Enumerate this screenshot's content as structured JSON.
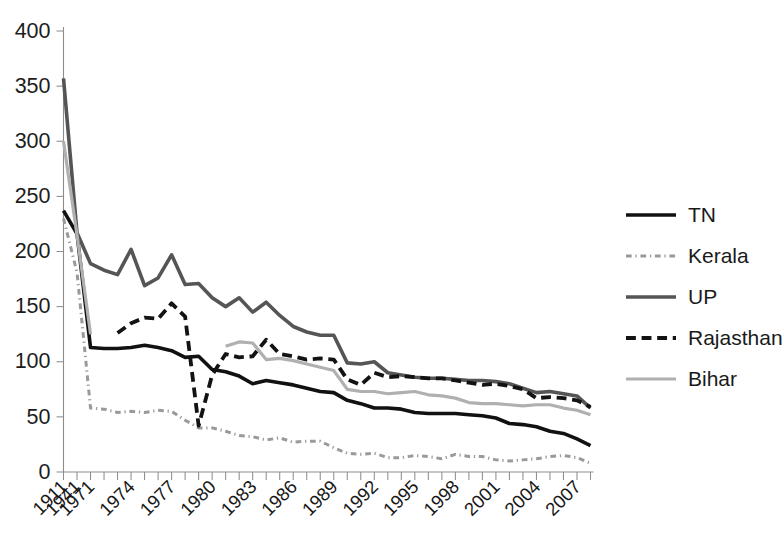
{
  "chart_data": {
    "type": "line",
    "title": "",
    "xlabel": "",
    "ylabel": "",
    "ylim": [
      0,
      400
    ],
    "ytick_values": [
      0,
      50,
      100,
      150,
      200,
      250,
      300,
      350,
      400
    ],
    "ytick_labels": [
      "0",
      "50",
      "100",
      "150",
      "200",
      "250",
      "300",
      "350",
      "400"
    ],
    "grid": false,
    "legend_position": "right",
    "x_axis_note": "Irregular axis: early census years 1911 and 1941, then annual ticks from 1971 to 2008",
    "x_slots": [
      "1911",
      "1941",
      "1971",
      "1972",
      "1973",
      "1974",
      "1975",
      "1976",
      "1977",
      "1978",
      "1979",
      "1980",
      "1981",
      "1982",
      "1983",
      "1984",
      "1985",
      "1986",
      "1987",
      "1988",
      "1989",
      "1990",
      "1991",
      "1992",
      "1993",
      "1994",
      "1995",
      "1996",
      "1997",
      "1998",
      "1999",
      "2000",
      "2001",
      "2002",
      "2003",
      "2004",
      "2005",
      "2006",
      "2007",
      "2008"
    ],
    "xtick_labels": [
      "1911",
      "1941",
      "1971",
      "1974",
      "1977",
      "1980",
      "1983",
      "1986",
      "1989",
      "1992",
      "1995",
      "1998",
      "2001",
      "2004",
      "2007"
    ],
    "xtick_label_slots": [
      0,
      1,
      2,
      5,
      8,
      11,
      14,
      17,
      20,
      23,
      26,
      29,
      32,
      35,
      38
    ],
    "series": [
      {
        "name": "TN",
        "color": "#111111",
        "style": "solid",
        "width": 3.6,
        "values": [
          237,
          216,
          113,
          112,
          112,
          113,
          115,
          113,
          110,
          104,
          105,
          93,
          91,
          87,
          80,
          83,
          81,
          79,
          76,
          73,
          72,
          65,
          62,
          58,
          58,
          57,
          54,
          53,
          53,
          53,
          52,
          51,
          49,
          44,
          43,
          41,
          37,
          35,
          30,
          24
        ]
      },
      {
        "name": "Kerala",
        "color": "#9a9a9a",
        "style": "dashdot",
        "width": 3.0,
        "values": [
          230,
          181,
          58,
          57,
          54,
          55,
          54,
          56,
          55,
          47,
          40,
          40,
          37,
          33,
          32,
          29,
          31,
          27,
          28,
          28,
          22,
          17,
          16,
          17,
          13,
          13,
          15,
          14,
          12,
          16,
          14,
          14,
          11,
          10,
          11,
          12,
          14,
          15,
          13,
          8
        ]
      },
      {
        "name": "UP",
        "color": "#555555",
        "style": "solid",
        "width": 3.6,
        "values": [
          357,
          217,
          189,
          183,
          179,
          202,
          169,
          176,
          197,
          170,
          171,
          158,
          150,
          158,
          145,
          154,
          142,
          132,
          127,
          124,
          124,
          99,
          98,
          100,
          90,
          88,
          86,
          85,
          85,
          84,
          83,
          83,
          82,
          80,
          76,
          72,
          73,
          71,
          69,
          58
        ]
      },
      {
        "name": "Rajasthan",
        "color": "#131313",
        "style": "dashed",
        "width": 3.8,
        "values": [
          null,
          null,
          null,
          null,
          126,
          135,
          140,
          139,
          153,
          141,
          42,
          88,
          107,
          104,
          105,
          120,
          107,
          105,
          102,
          103,
          102,
          84,
          79,
          90,
          86,
          87,
          86,
          85,
          85,
          83,
          81,
          79,
          80,
          78,
          75,
          67,
          68,
          67,
          65,
          59
        ]
      },
      {
        "name": "Bihar",
        "color": "#b0b0b0",
        "style": "solid",
        "width": 3.2,
        "values": [
          300,
          215,
          125,
          null,
          null,
          null,
          null,
          null,
          null,
          null,
          null,
          null,
          114,
          118,
          117,
          102,
          103,
          101,
          98,
          95,
          92,
          75,
          73,
          73,
          71,
          72,
          73,
          70,
          69,
          67,
          63,
          62,
          62,
          61,
          60,
          61,
          61,
          58,
          56,
          52
        ]
      }
    ]
  },
  "legend": {
    "items": [
      {
        "label": "TN"
      },
      {
        "label": "Kerala"
      },
      {
        "label": "UP"
      },
      {
        "label": "Rajasthan"
      },
      {
        "label": "Bihar"
      }
    ]
  }
}
